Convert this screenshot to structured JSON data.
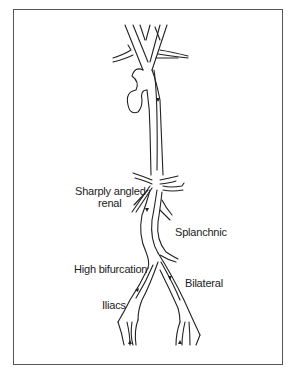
{
  "diagram": {
    "labels": {
      "renal_line1": "Sharply angled",
      "renal_line2": "renal",
      "splanchnic": "Splanchnic",
      "high_bifurcation": "High bifurcation",
      "bilateral": "Bilateral",
      "iliacs": "Iliacs"
    },
    "colors": {
      "line": "#222222",
      "frame": "#555555",
      "background": "#ffffff"
    }
  }
}
